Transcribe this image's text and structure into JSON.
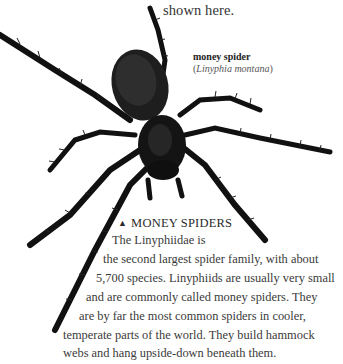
{
  "page": {
    "intro_tail": "shown here.",
    "figure": {
      "image_subject": "spider-photograph",
      "caption": {
        "common_name": "money spider",
        "latin_open": "(",
        "latin_name": "Linyphia montana",
        "latin_close": ")"
      }
    },
    "section": {
      "marker_icon": "triangle-up-icon",
      "marker_glyph": "▲",
      "heading": "MONEY SPIDERS",
      "body_lines": [
        "The Linyphiidae is",
        "the second largest spider family, with about",
        "5,700 species. Linyphiids are usually very small",
        "and are commonly called money spiders. They",
        "are by far the most common spiders in cooler,",
        "temperate parts of the world. They build hammock",
        "webs and hang upside-down beneath them."
      ]
    }
  }
}
